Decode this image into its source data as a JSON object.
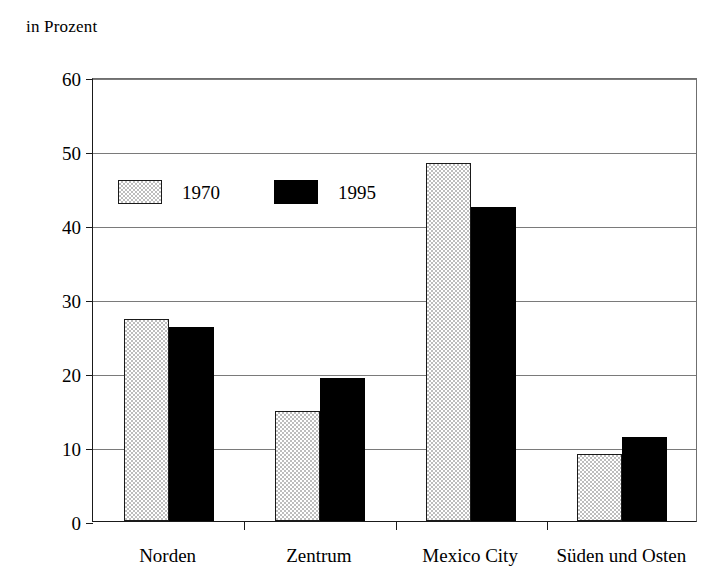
{
  "chart_data": {
    "type": "bar",
    "title": "in Prozent",
    "xlabel": "",
    "ylabel": "",
    "ylim": [
      0,
      60
    ],
    "yticks": [
      0,
      10,
      20,
      30,
      40,
      50,
      60
    ],
    "ytick_labels": [
      "0",
      "10",
      "20",
      "30",
      "40",
      "50",
      "60"
    ],
    "grid": "horizontal",
    "legend_position": "inside-upper-left",
    "categories": [
      "Norden",
      "Zentrum",
      "Mexico City",
      "Süden und Osten"
    ],
    "series": [
      {
        "name": "1970",
        "color": "#bdbdbd",
        "pattern": "checkerboard",
        "values": [
          27.3,
          14.8,
          48.4,
          9.0
        ]
      },
      {
        "name": "1995",
        "color": "#000000",
        "pattern": "solid",
        "values": [
          26.2,
          19.3,
          42.5,
          11.3
        ]
      }
    ]
  },
  "legend": {
    "entries": [
      {
        "label": "1970",
        "swatch": "hatched-gray-swatch"
      },
      {
        "label": "1995",
        "swatch": "solid-black-swatch"
      }
    ]
  }
}
